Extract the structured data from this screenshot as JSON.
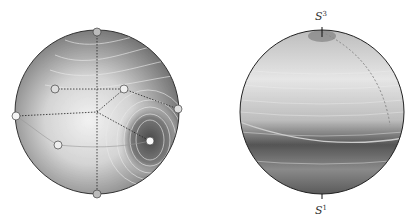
{
  "figure": {
    "left_panel": {
      "name": "contour-disk",
      "critical_points": 8
    },
    "right_panel": {
      "name": "shaded-sphere",
      "top_label": {
        "base": "S",
        "sup": "3"
      },
      "bottom_label": {
        "base": "S",
        "sup": "1"
      }
    }
  }
}
